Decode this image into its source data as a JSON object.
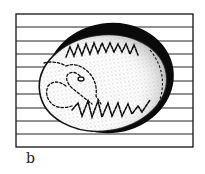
{
  "figure": {
    "label": "b",
    "colors": {
      "ink": "#111111",
      "paper": "#ffffff",
      "stipple": "#bdbdbd"
    },
    "ruled_lines_count": 9
  }
}
